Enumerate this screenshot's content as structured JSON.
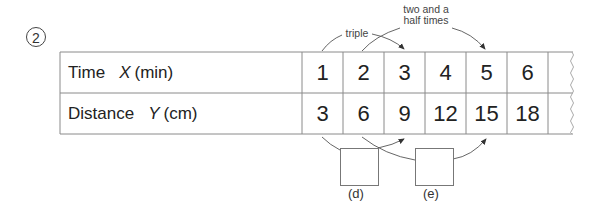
{
  "question_number": "2",
  "table": {
    "rows": [
      {
        "name": "Time",
        "variable": "X",
        "unit": "(min)",
        "values": [
          "1",
          "2",
          "3",
          "4",
          "5",
          "6"
        ]
      },
      {
        "name": "Distance",
        "variable": "Y",
        "unit": "(cm)",
        "values": [
          "3",
          "6",
          "9",
          "12",
          "15",
          "18"
        ]
      }
    ]
  },
  "annotations": {
    "top_left": "triple",
    "top_right_line1": "two and a",
    "top_right_line2": "half times",
    "blank_d_label": "(d)",
    "blank_e_label": "(e)"
  },
  "colors": {
    "line": "#888888",
    "text": "#222222",
    "arrow": "#333333"
  }
}
